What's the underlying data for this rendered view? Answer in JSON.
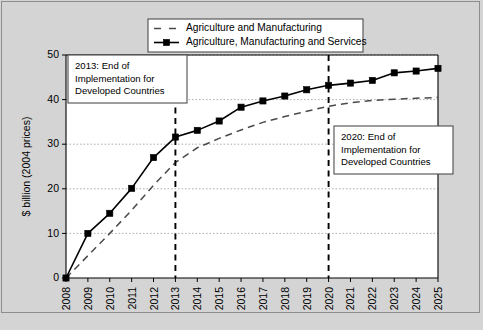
{
  "chart_data": {
    "type": "line",
    "title": "",
    "xlabel": "",
    "ylabel": "$ billion (2004 prices)",
    "x": [
      2008,
      2009,
      2010,
      2011,
      2012,
      2013,
      2014,
      2015,
      2016,
      2017,
      2018,
      2019,
      2020,
      2021,
      2022,
      2023,
      2024,
      2025
    ],
    "xtick_labels": [
      "2008",
      "2009",
      "2010",
      "2011",
      "2012",
      "2013",
      "2014",
      "2015",
      "2016",
      "2017",
      "2018",
      "2019",
      "2020",
      "2021",
      "2022",
      "2023",
      "2024",
      "2025"
    ],
    "ytick_labels": [
      "0",
      "10",
      "20",
      "30",
      "40",
      "50"
    ],
    "yticks": [
      0,
      10,
      20,
      30,
      40,
      50
    ],
    "ylim": [
      0,
      50
    ],
    "xlim": [
      2008,
      2025
    ],
    "grid": true,
    "legend_position": "top-center",
    "series": [
      {
        "name": "Agriculture and Manufacturing",
        "style": "dashed",
        "color": "#4a4a4a",
        "markers": false,
        "values": [
          0,
          5.0,
          10.0,
          15.2,
          20.8,
          25.9,
          29.2,
          31.3,
          33.2,
          34.9,
          36.2,
          37.4,
          38.5,
          39.3,
          39.8,
          40.1,
          40.3,
          40.5
        ]
      },
      {
        "name": "Agriculture, Manufacturing and Services",
        "style": "solid",
        "color": "#000000",
        "markers": true,
        "values": [
          0,
          10.0,
          14.5,
          20.1,
          27.0,
          31.6,
          33.1,
          35.2,
          38.3,
          39.7,
          40.8,
          42.2,
          43.2,
          43.7,
          44.3,
          46.0,
          46.4,
          47.0
        ]
      }
    ],
    "annotations": [
      {
        "id": "vline-2013",
        "x": 2013,
        "type": "vertical-dashed-line",
        "label_lines": [
          "2013: End of",
          "Implementation for",
          "Developed Countries"
        ]
      },
      {
        "id": "vline-2020",
        "x": 2020,
        "type": "vertical-dashed-line",
        "label_lines": [
          "2020: End of",
          "Implementation for",
          "Developed Countries"
        ]
      }
    ]
  },
  "legend": {
    "entries": [
      {
        "label": "Agriculture and Manufacturing"
      },
      {
        "label": "Agriculture, Manufacturing and Services"
      }
    ]
  },
  "callouts": {
    "left": {
      "line1": "2013: End of",
      "line2": "Implementation for",
      "line3": "Developed Countries"
    },
    "right": {
      "line1": "2020: End of",
      "line2": "Implementation for",
      "line3": "Developed Countries"
    }
  },
  "axes": {
    "y_title": "$ billion (2004 prices)",
    "y_ticks": [
      "50",
      "40",
      "30",
      "20",
      "10",
      "0"
    ],
    "x_ticks": [
      "2008",
      "2009",
      "2010",
      "2011",
      "2012",
      "2013",
      "2014",
      "2015",
      "2016",
      "2017",
      "2018",
      "2019",
      "2020",
      "2021",
      "2022",
      "2023",
      "2024",
      "2025"
    ]
  },
  "colors": {
    "figure_background": "#d4d4d4",
    "plot_background": "#ffffff",
    "solid_series": "#000000",
    "dashed_series": "#4a4a4a",
    "gridline": "#9a9a9a"
  }
}
